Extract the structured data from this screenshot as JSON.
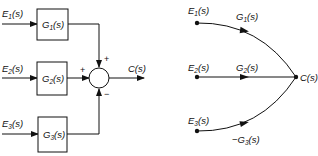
{
  "block_diagram": {
    "inputs": [
      {
        "label": "E",
        "sub": "1",
        "arg": "(s)"
      },
      {
        "label": "E",
        "sub": "2",
        "arg": "(s)"
      },
      {
        "label": "E",
        "sub": "3",
        "arg": "(s)"
      }
    ],
    "blocks": [
      {
        "label": "G",
        "sub": "1",
        "arg": "(s)"
      },
      {
        "label": "G",
        "sub": "2",
        "arg": "(s)"
      },
      {
        "label": "G",
        "sub": "3",
        "arg": "(s)"
      }
    ],
    "summing_junction": {
      "signs": [
        "+",
        "+",
        "−"
      ]
    },
    "output": {
      "label": "C(s)"
    }
  },
  "signal_flow_graph": {
    "nodes": [
      {
        "label": "E",
        "sub": "1",
        "arg": "(s)"
      },
      {
        "label": "E",
        "sub": "2",
        "arg": "(s)"
      },
      {
        "label": "E",
        "sub": "3",
        "arg": "(s)"
      },
      {
        "label": "C(s)"
      }
    ],
    "branches": [
      {
        "prefix": "",
        "label": "G",
        "sub": "1",
        "arg": "(s)"
      },
      {
        "prefix": "",
        "label": "G",
        "sub": "2",
        "arg": "(s)"
      },
      {
        "prefix": "−",
        "label": "G",
        "sub": "3",
        "arg": "(s)"
      }
    ]
  }
}
